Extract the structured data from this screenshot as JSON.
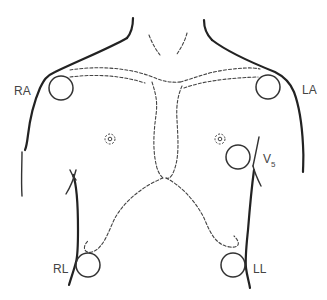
{
  "figure": {
    "colors": {
      "line": "#222222",
      "label": "#444444",
      "background": "#ffffff"
    }
  },
  "electrodes": [
    {
      "id": "RA",
      "label": "RA",
      "name": "right-arm"
    },
    {
      "id": "LA",
      "label": "LA",
      "name": "left-arm"
    },
    {
      "id": "V5",
      "label": "V",
      "subscript": "5",
      "name": "v5-chest"
    },
    {
      "id": "RL",
      "label": "RL",
      "name": "right-leg"
    },
    {
      "id": "LL",
      "label": "LL",
      "name": "left-leg"
    }
  ]
}
